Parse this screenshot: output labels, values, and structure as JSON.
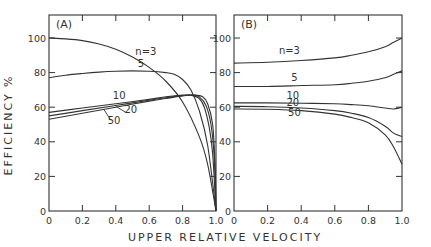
{
  "chart_data": [
    {
      "type": "line",
      "panel": "(A)",
      "xlabel": "UPPER RELATIVE VELOCITY",
      "ylabel": "EFFICIENCY %",
      "xlim": [
        0,
        1.0
      ],
      "ylim": [
        0,
        100
      ],
      "xticks": [
        "0",
        "0.2",
        "0.4",
        "0.6",
        "0.8",
        "1.0"
      ],
      "yticks": [
        "0",
        "20",
        "40",
        "60",
        "80",
        "100"
      ],
      "series": [
        {
          "name": "n=3",
          "x": [
            0,
            0.1,
            0.2,
            0.3,
            0.4,
            0.5,
            0.6,
            0.7,
            0.8,
            0.9,
            0.95,
            1.0
          ],
          "values": [
            100,
            99.5,
            98.5,
            96.5,
            93.5,
            89,
            83,
            75,
            63,
            43,
            27,
            0
          ]
        },
        {
          "name": "5",
          "x": [
            0,
            0.1,
            0.2,
            0.3,
            0.4,
            0.5,
            0.6,
            0.7,
            0.75,
            0.8,
            0.85,
            0.9,
            0.95,
            1.0
          ],
          "values": [
            77,
            78.5,
            79.5,
            80.3,
            80.8,
            81,
            80.8,
            80,
            79,
            76,
            70,
            58,
            38,
            0
          ]
        },
        {
          "name": "10",
          "x": [
            0,
            0.2,
            0.4,
            0.6,
            0.7,
            0.8,
            0.85,
            0.9,
            0.93,
            0.96,
            0.98,
            1.0
          ],
          "values": [
            57,
            59.5,
            62,
            64.5,
            66,
            67,
            67,
            65,
            60,
            48,
            33,
            0
          ]
        },
        {
          "name": "20",
          "x": [
            0,
            0.2,
            0.4,
            0.6,
            0.7,
            0.8,
            0.86,
            0.9,
            0.94,
            0.97,
            0.99,
            1.0
          ],
          "values": [
            55,
            58,
            61,
            64,
            65.5,
            66.7,
            67,
            66,
            61,
            50,
            30,
            0
          ]
        },
        {
          "name": "50",
          "x": [
            0,
            0.2,
            0.4,
            0.6,
            0.7,
            0.8,
            0.87,
            0.92,
            0.95,
            0.98,
            0.995,
            1.0
          ],
          "values": [
            53,
            56.5,
            60,
            63.5,
            65,
            66.5,
            67,
            66,
            62,
            50,
            25,
            0
          ]
        }
      ],
      "labels": [
        {
          "text": "n=3",
          "x": 0.58,
          "y": 90
        },
        {
          "text": "5",
          "x": 0.55,
          "y": 83.5
        },
        {
          "text": "10",
          "x": 0.42,
          "y": 65
        },
        {
          "text": "20",
          "x": 0.49,
          "y": 56.5
        },
        {
          "text": "50",
          "x": 0.39,
          "y": 50.5
        }
      ]
    },
    {
      "type": "line",
      "panel": "(B)",
      "xlabel": "UPPER RELATIVE VELOCITY",
      "ylabel": "EFFICIENCY %",
      "xlim": [
        0,
        1.0
      ],
      "ylim": [
        0,
        100
      ],
      "xticks": [
        "0",
        "0.2",
        "0.4",
        "0.6",
        "0.8",
        "1.0"
      ],
      "yticks": [
        "0",
        "20",
        "40",
        "60",
        "80",
        "100"
      ],
      "series": [
        {
          "name": "n=3",
          "x": [
            0,
            0.2,
            0.4,
            0.6,
            0.7,
            0.8,
            0.9,
            0.95,
            1.0
          ],
          "values": [
            85.5,
            86,
            87,
            88.5,
            90,
            92,
            95,
            97.5,
            100
          ]
        },
        {
          "name": "5",
          "x": [
            0,
            0.2,
            0.4,
            0.6,
            0.7,
            0.8,
            0.9,
            0.95,
            1.0
          ],
          "values": [
            72,
            72,
            72.5,
            73,
            73.8,
            75,
            77,
            79,
            81
          ]
        },
        {
          "name": "10",
          "x": [
            0,
            0.2,
            0.4,
            0.6,
            0.7,
            0.8,
            0.9,
            0.95,
            1.0
          ],
          "values": [
            62.5,
            62.5,
            62.3,
            62,
            61.5,
            60.8,
            59.5,
            59,
            60
          ]
        },
        {
          "name": "20",
          "x": [
            0,
            0.2,
            0.4,
            0.6,
            0.7,
            0.8,
            0.9,
            0.95,
            1.0
          ],
          "values": [
            60.5,
            60.3,
            59.5,
            58,
            56.5,
            54,
            49,
            45,
            43
          ]
        },
        {
          "name": "50",
          "x": [
            0,
            0.2,
            0.4,
            0.6,
            0.7,
            0.8,
            0.9,
            0.95,
            1.0
          ],
          "values": [
            59,
            58.8,
            58,
            56,
            54,
            51,
            44,
            37,
            27
          ]
        }
      ],
      "labels": [
        {
          "text": "n=3",
          "x": 0.33,
          "y": 90.5
        },
        {
          "text": "5",
          "x": 0.36,
          "y": 75
        },
        {
          "text": "10",
          "x": 0.35,
          "y": 65
        },
        {
          "text": "20",
          "x": 0.35,
          "y": 60.5
        },
        {
          "text": "50",
          "x": 0.36,
          "y": 55
        }
      ]
    }
  ],
  "figure": {
    "xlabel": "UPPER RELATIVE VELOCITY",
    "ylabel": "EFFICIENCY %",
    "line_color": "#333333",
    "text_color": "#333333"
  }
}
